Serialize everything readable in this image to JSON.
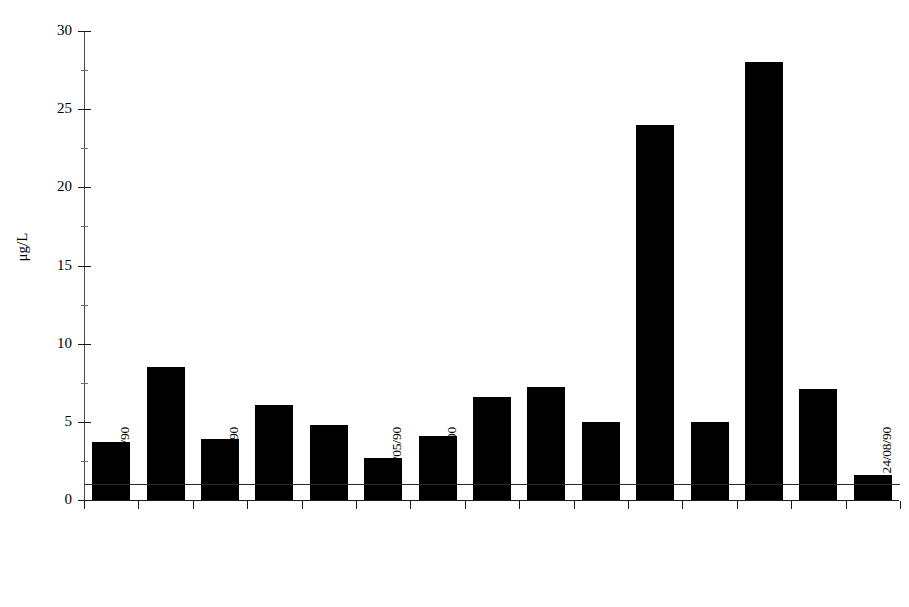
{
  "chart_data": {
    "type": "bar",
    "title": "",
    "xlabel": "",
    "ylabel": "μg/L",
    "ylim": [
      0,
      30
    ],
    "ytick_labels": [
      "0",
      "5",
      "10",
      "15",
      "20",
      "25",
      "30"
    ],
    "ytick_values": [
      0,
      5,
      10,
      15,
      20,
      25,
      30
    ],
    "yminor_values": [
      2.5,
      7.5,
      12.5,
      17.5,
      22.5,
      27.5
    ],
    "grid": false,
    "legend": "none",
    "bar_color": "#000000",
    "categories": [
      "11/02/90",
      "13/02/90",
      "19/02/90",
      "21/02/90",
      "23/02/90",
      "7/05/90",
      "9/05/90",
      "15/05/90",
      "23/05/90",
      "25/05/90",
      "6/08/90",
      "8/08/90",
      "16/08/90",
      "21/08/90",
      "24/08/90"
    ],
    "values": [
      3.7,
      8.5,
      3.9,
      6.1,
      4.8,
      2.7,
      4.1,
      6.6,
      7.2,
      5.0,
      24.0,
      5.0,
      28.0,
      7.1,
      1.6
    ],
    "annotations": [
      {
        "name": "threshold-line",
        "type": "horizontal-reference-line",
        "value": 1.0,
        "color": "#2b2b2b"
      }
    ]
  }
}
